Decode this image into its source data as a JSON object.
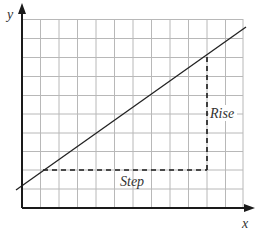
{
  "diagram": {
    "type": "slope-rise-over-step",
    "axes": {
      "x_label": "x",
      "y_label": "y"
    },
    "grid": {
      "columns": 12,
      "rows": 10,
      "color": "#b8b8b8"
    },
    "line": {
      "description": "straight line with positive slope",
      "color": "#222222"
    },
    "annotations": {
      "step_label": "Step",
      "rise_label": "Rise"
    },
    "colors": {
      "axis": "#1a1a1a",
      "dashed": "#1a1a1a",
      "text": "#333333"
    }
  }
}
